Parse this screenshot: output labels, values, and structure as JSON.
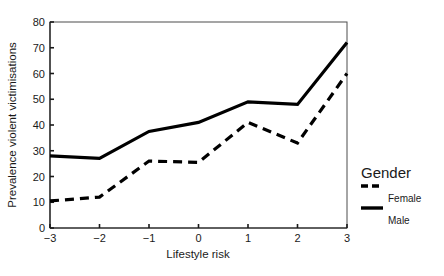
{
  "chart_data": {
    "type": "line",
    "title": "",
    "xlabel": "Lifestyle risk",
    "ylabel": "Prevalence violent victimisations",
    "x": [
      -3,
      -2,
      -1,
      0,
      1,
      2,
      3
    ],
    "xticklabels": [
      "−3",
      "−2",
      "−1",
      "0",
      "1",
      "2",
      "3"
    ],
    "yticks": [
      0,
      10,
      20,
      30,
      40,
      50,
      60,
      70,
      80
    ],
    "yticklabels": [
      "0",
      "10",
      "20",
      "30",
      "40",
      "50",
      "60",
      "70",
      "80"
    ],
    "xlim": [
      -3,
      3
    ],
    "ylim": [
      0,
      80
    ],
    "grid": false,
    "legend_position": "right",
    "legend_title": "Gender",
    "series": [
      {
        "name": "Female",
        "style": "dashed",
        "color": "#000000",
        "values": [
          10.5,
          12.0,
          26.0,
          25.5,
          41.0,
          33.0,
          60.0
        ]
      },
      {
        "name": "Male",
        "style": "solid",
        "color": "#000000",
        "values": [
          28.0,
          27.0,
          37.5,
          41.0,
          49.0,
          48.0,
          72.0
        ]
      }
    ]
  },
  "axes": {
    "y_title": "Prevalence violent victimisations",
    "x_title": "Lifestyle risk"
  },
  "legend": {
    "title": "Gender",
    "entries": [
      {
        "label": "Female",
        "style": "dashed"
      },
      {
        "label": "Male",
        "style": "solid"
      }
    ]
  }
}
